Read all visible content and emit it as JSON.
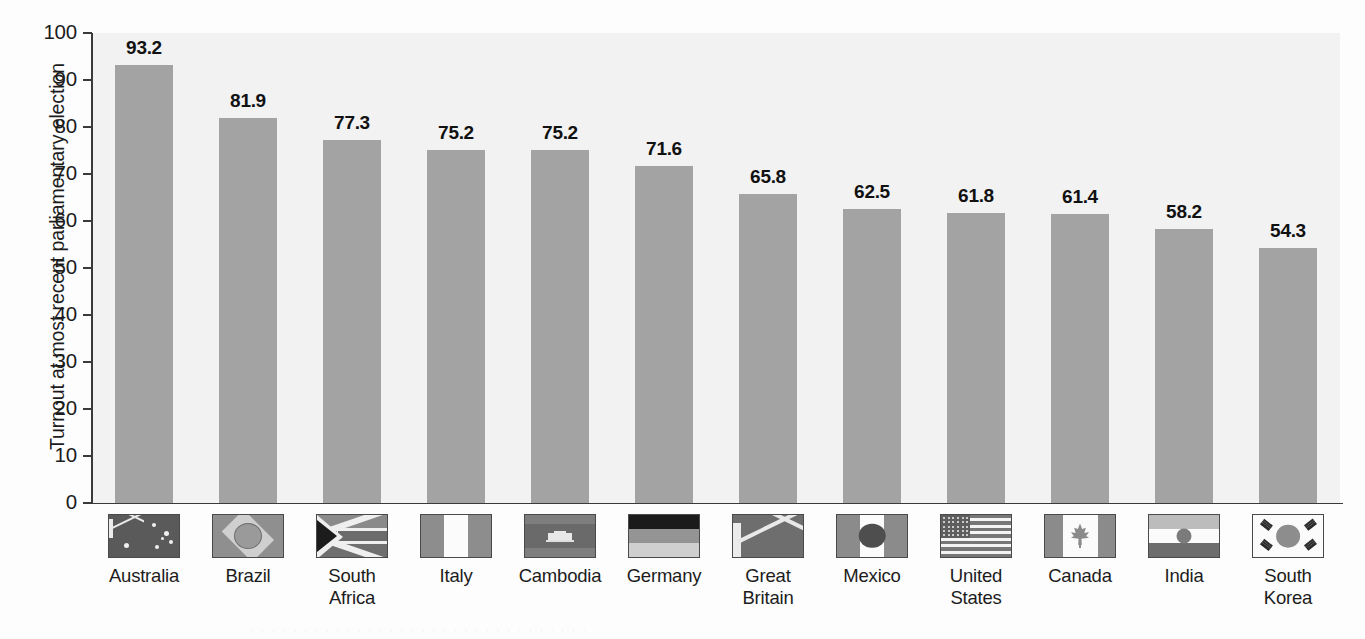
{
  "chart_data": {
    "type": "bar",
    "title": "",
    "subtitle": "",
    "xlabel": "",
    "ylabel": "Turnout at most recent parliamentary election",
    "ylim": [
      0,
      100
    ],
    "yticks": [
      "0",
      "10",
      "20",
      "30",
      "40",
      "50",
      "60",
      "70",
      "80",
      "90",
      "100"
    ],
    "ytick_values": [
      0,
      10,
      20,
      30,
      40,
      50,
      60,
      70,
      80,
      90,
      100
    ],
    "grid": false,
    "legend": "none",
    "bar_color": "#a3a3a3",
    "plot_background": "#f2f2f2",
    "categories": [
      "Australia",
      "Brazil",
      "South Africa",
      "Italy",
      "Cambodia",
      "Germany",
      "Great Britain",
      "Mexico",
      "United States",
      "Canada",
      "India",
      "South Korea"
    ],
    "values": [
      93.2,
      81.9,
      77.3,
      75.2,
      75.2,
      71.6,
      65.8,
      62.5,
      61.8,
      61.4,
      58.2,
      54.3
    ],
    "value_labels": [
      "93.2",
      "81.9",
      "77.3",
      "75.2",
      "75.2",
      "71.6",
      "65.8",
      "62.5",
      "61.8",
      "61.4",
      "58.2",
      "54.3"
    ]
  },
  "axis": {
    "y_title": "Turnout at most recent parliamentary election",
    "ticks": [
      {
        "label": "100",
        "value": 100
      },
      {
        "label": "90",
        "value": 90
      },
      {
        "label": "80",
        "value": 80
      },
      {
        "label": "70",
        "value": 70
      },
      {
        "label": "60",
        "value": 60
      },
      {
        "label": "50",
        "value": 50
      },
      {
        "label": "40",
        "value": 40
      },
      {
        "label": "30",
        "value": 30
      },
      {
        "label": "20",
        "value": 20
      },
      {
        "label": "10",
        "value": 10
      },
      {
        "label": "0",
        "value": 0
      }
    ]
  },
  "countries": [
    {
      "name": "Australia",
      "name_lines": [
        "Australia"
      ],
      "value_label": "93.2",
      "value": 93.2,
      "flag": "flag-australia"
    },
    {
      "name": "Brazil",
      "name_lines": [
        "Brazil"
      ],
      "value_label": "81.9",
      "value": 81.9,
      "flag": "flag-brazil"
    },
    {
      "name": "South Africa",
      "name_lines": [
        "South",
        "Africa"
      ],
      "value_label": "77.3",
      "value": 77.3,
      "flag": "flag-south-africa"
    },
    {
      "name": "Italy",
      "name_lines": [
        "Italy"
      ],
      "value_label": "75.2",
      "value": 75.2,
      "flag": "flag-italy"
    },
    {
      "name": "Cambodia",
      "name_lines": [
        "Cambodia"
      ],
      "value_label": "75.2",
      "value": 75.2,
      "flag": "flag-cambodia"
    },
    {
      "name": "Germany",
      "name_lines": [
        "Germany"
      ],
      "value_label": "71.6",
      "value": 71.6,
      "flag": "flag-germany"
    },
    {
      "name": "Great Britain",
      "name_lines": [
        "Great",
        "Britain"
      ],
      "value_label": "65.8",
      "value": 65.8,
      "flag": "flag-great-britain"
    },
    {
      "name": "Mexico",
      "name_lines": [
        "Mexico"
      ],
      "value_label": "62.5",
      "value": 62.5,
      "flag": "flag-mexico"
    },
    {
      "name": "United States",
      "name_lines": [
        "United",
        "States"
      ],
      "value_label": "61.8",
      "value": 61.8,
      "flag": "flag-united-states"
    },
    {
      "name": "Canada",
      "name_lines": [
        "Canada"
      ],
      "value_label": "61.4",
      "value": 61.4,
      "flag": "flag-canada"
    },
    {
      "name": "India",
      "name_lines": [
        "India"
      ],
      "value_label": "58.2",
      "value": 58.2,
      "flag": "flag-india"
    },
    {
      "name": "South Korea",
      "name_lines": [
        "South",
        "Korea"
      ],
      "value_label": "54.3",
      "value": 54.3,
      "flag": "flag-south-korea"
    }
  ]
}
